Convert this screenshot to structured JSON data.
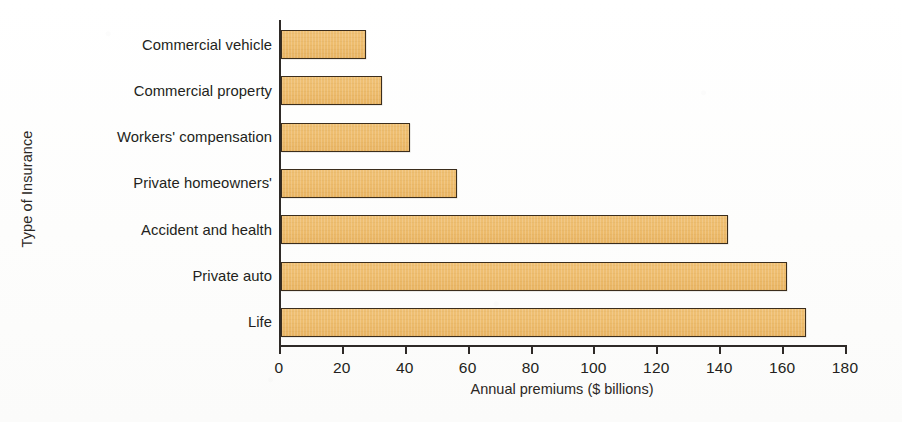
{
  "chart_data": {
    "type": "bar",
    "orientation": "horizontal",
    "title": "",
    "xlabel": "Annual premiums ($ billions)",
    "ylabel": "Type of Insurance",
    "categories": [
      "Commercial vehicle",
      "Commercial property",
      "Workers' compensation",
      "Private homeowners'",
      "Accident and health",
      "Private auto",
      "Life"
    ],
    "values": [
      27,
      32,
      41,
      56,
      142,
      161,
      167
    ],
    "xlim": [
      0,
      180
    ],
    "xticks": [
      0,
      20,
      40,
      60,
      80,
      100,
      120,
      140,
      160,
      180
    ],
    "xticklabels": [
      "0",
      "20",
      "40",
      "60",
      "80",
      "100",
      "120",
      "140",
      "160",
      "180"
    ],
    "grid": false,
    "legend": null,
    "bar_fill_color": "#EEBE70",
    "bar_edge_color": "#3B2D1C",
    "axis_color": "#2E2A27",
    "background_color": "#FEFEFE"
  }
}
